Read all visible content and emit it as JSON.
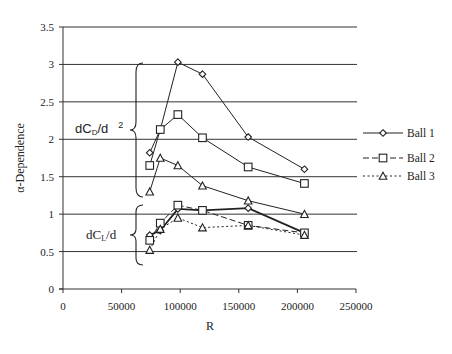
{
  "chart_data": {
    "type": "line",
    "title": "",
    "xlabel": "R",
    "ylabel": "α-Dependence",
    "xlim": [
      0,
      250000
    ],
    "ylim": [
      0,
      3.5
    ],
    "xticks": [
      0,
      50000,
      100000,
      150000,
      200000,
      250000
    ],
    "xtick_labels": [
      "0",
      "50000",
      "100000",
      "150000",
      "200000",
      "250000"
    ],
    "yticks": [
      0,
      0.5,
      1,
      1.5,
      2,
      2.5,
      3,
      3.5
    ],
    "ytick_labels": [
      "0",
      "0.5",
      "1",
      "1.5",
      "2",
      "2.5",
      "3",
      "3.5"
    ],
    "grid": "horizontal",
    "legend_position": "right",
    "annotations": [
      {
        "text": "dC",
        "sub": "D",
        "after": "/d",
        "sup": "2",
        "group": "drag",
        "note": "upper group of curves (brace)"
      },
      {
        "text": "dC",
        "sub": "L",
        "after": "/d",
        "group": "lift",
        "note": "lower group of curves (brace)"
      }
    ],
    "x": [
      74000,
      83000,
      98000,
      119000,
      158000,
      206000
    ],
    "series": [
      {
        "name": "Ball 1",
        "marker": "diamond",
        "line": "solid",
        "group": "drag",
        "values": [
          1.82,
          2.13,
          3.03,
          2.87,
          2.03,
          1.6
        ]
      },
      {
        "name": "Ball 2",
        "marker": "square",
        "line": "solid",
        "group": "drag",
        "values": [
          1.65,
          2.13,
          2.33,
          2.02,
          1.63,
          1.41
        ]
      },
      {
        "name": "Ball 3",
        "marker": "triangle",
        "line": "solid",
        "group": "drag",
        "values": [
          1.3,
          1.75,
          1.65,
          1.38,
          1.18,
          1.0
        ]
      },
      {
        "name": "Ball 1",
        "marker": "diamond",
        "line": "solid-bold",
        "group": "lift",
        "values": [
          0.72,
          0.78,
          1.07,
          1.05,
          1.08,
          0.75
        ]
      },
      {
        "name": "Ball 2",
        "marker": "square",
        "line": "dashed",
        "group": "lift",
        "values": [
          0.65,
          0.88,
          1.12,
          1.05,
          0.85,
          0.75
        ]
      },
      {
        "name": "Ball 3",
        "marker": "triangle",
        "line": "dotted",
        "group": "lift",
        "values": [
          0.52,
          0.8,
          0.95,
          0.82,
          0.85,
          0.72
        ]
      }
    ],
    "legend": [
      {
        "label": "Ball 1",
        "marker": "diamond",
        "line": "solid"
      },
      {
        "label": "Ball 2",
        "marker": "square",
        "line": "dashed"
      },
      {
        "label": "Ball 3",
        "marker": "triangle",
        "line": "dotted"
      }
    ]
  },
  "labels": {
    "cd_main": "dC",
    "cd_sub": "D",
    "cd_after": "/d",
    "cd_sup": "2",
    "cl_main": "dC",
    "cl_sub": "L",
    "cl_after": "/d"
  }
}
